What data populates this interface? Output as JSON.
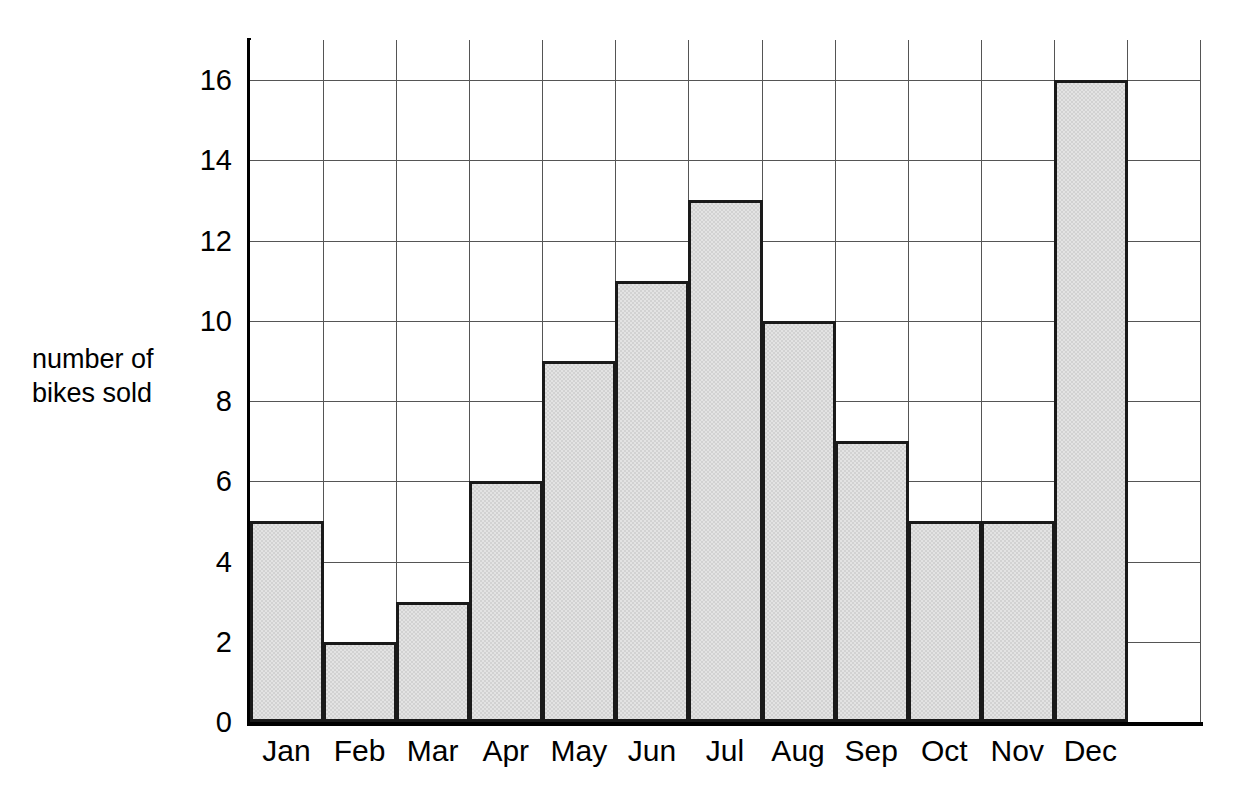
{
  "chart_data": {
    "type": "bar",
    "title": "",
    "xlabel": "",
    "ylabel": "number of bikes sold",
    "ylabel_lines": [
      "number of",
      "bikes sold"
    ],
    "categories": [
      "Jan",
      "Feb",
      "Mar",
      "Apr",
      "May",
      "Jun",
      "Jul",
      "Aug",
      "Sep",
      "Oct",
      "Nov",
      "Dec"
    ],
    "values": [
      5,
      2,
      3,
      6,
      9,
      11,
      13,
      10,
      7,
      5,
      5,
      16
    ],
    "ylim": [
      0,
      17
    ],
    "ytick_labels": [
      "0",
      "2",
      "4",
      "6",
      "8",
      "10",
      "12",
      "14",
      "16"
    ],
    "ytick_values": [
      0,
      2,
      4,
      6,
      8,
      10,
      12,
      14,
      16
    ],
    "grid": true,
    "grid_columns": 13,
    "legend": "none",
    "bar_style": "adjacent-histogram",
    "colors": {
      "bar_fill": "#d2d2d2",
      "bar_border": "#1a1a1a",
      "gridline": "#555555",
      "axis": "#000000",
      "background": "#ffffff",
      "text": "#000000"
    }
  }
}
